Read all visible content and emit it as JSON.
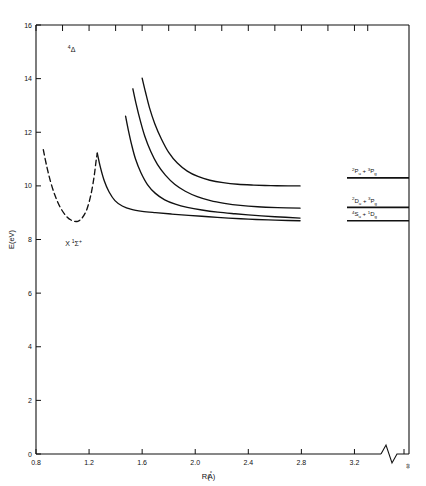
{
  "chart_data": {
    "type": "line",
    "title": "",
    "xlabel": "R(A)",
    "xlabel_parts": {
      "pre": "R(",
      "ring": "°",
      "mid": "A",
      "post": ")"
    },
    "ylabel": "E(eV)",
    "xlim": [
      0.8,
      3.4
    ],
    "ylim": [
      0,
      16
    ],
    "xticks": [
      "0.8",
      "1.2",
      "1.6",
      "2.0",
      "2.4",
      "2.8",
      "3.2"
    ],
    "xtick_values": [
      0.8,
      1.2,
      1.6,
      2.0,
      2.4,
      2.8,
      3.2
    ],
    "yticks": [
      "0",
      "2",
      "4",
      "6",
      "8",
      "10",
      "12",
      "14",
      "16"
    ],
    "ytick_values": [
      0,
      2,
      4,
      6,
      8,
      10,
      12,
      14,
      16
    ],
    "grid": false,
    "legend": "none",
    "axis_break": true,
    "infinity_tick": "∞",
    "annotations": [
      {
        "name": "quartet-delta-state",
        "text_parts": {
          "sup": "4",
          "main": "Δ"
        },
        "x": 1.04,
        "y": 15.0
      },
      {
        "name": "ground-state",
        "text_parts": {
          "x": "X ",
          "sup": "1",
          "main": "Σ",
          "post": "+"
        },
        "x": 1.02,
        "y": 7.75
      }
    ],
    "asymptote_levels": [
      {
        "name": "level-2Pu-3Pg",
        "energy": 10.3,
        "label_parts": {
          "a_sup": "2",
          "a_main": "P",
          "a_sub": "u",
          "plus": " + ",
          "b_sup": "3",
          "b_main": "P",
          "b_sub": "g"
        }
      },
      {
        "name": "level-2Du-3Pg",
        "energy": 9.2,
        "label_parts": {
          "a_sup": "2",
          "a_main": "D",
          "a_sub": "u",
          "plus": " + ",
          "b_sup": "3",
          "b_main": "P",
          "b_sub": "g"
        }
      },
      {
        "name": "level-4Su-1Dg",
        "energy": 8.7,
        "label_parts": {
          "a_sup": "4",
          "a_main": "S",
          "a_sub": "u",
          "plus": " + ",
          "b_sup": "1",
          "b_main": "D",
          "b_sub": "g"
        }
      }
    ],
    "series": [
      {
        "name": "ground-state-dashed-curve",
        "style": "dashed",
        "points": [
          [
            0.855,
            11.35
          ],
          [
            0.88,
            10.75
          ],
          [
            0.91,
            10.15
          ],
          [
            0.945,
            9.62
          ],
          [
            0.985,
            9.18
          ],
          [
            1.03,
            8.86
          ],
          [
            1.075,
            8.7
          ],
          [
            1.115,
            8.68
          ],
          [
            1.15,
            8.82
          ],
          [
            1.185,
            9.15
          ],
          [
            1.215,
            9.7
          ],
          [
            1.238,
            10.35
          ],
          [
            1.252,
            10.9
          ],
          [
            1.262,
            11.22
          ]
        ]
      },
      {
        "name": "curve-A-lowest",
        "style": "solid",
        "points": [
          [
            1.262,
            11.22
          ],
          [
            1.285,
            10.7
          ],
          [
            1.315,
            10.18
          ],
          [
            1.35,
            9.78
          ],
          [
            1.395,
            9.45
          ],
          [
            1.45,
            9.25
          ],
          [
            1.52,
            9.12
          ],
          [
            1.6,
            9.05
          ],
          [
            1.7,
            9.0
          ],
          [
            1.82,
            8.95
          ],
          [
            1.95,
            8.9
          ],
          [
            2.1,
            8.85
          ],
          [
            2.25,
            8.8
          ],
          [
            2.4,
            8.76
          ],
          [
            2.55,
            8.73
          ],
          [
            2.7,
            8.71
          ],
          [
            2.79,
            8.7
          ]
        ]
      },
      {
        "name": "curve-B",
        "style": "solid",
        "points": [
          [
            1.475,
            12.6
          ],
          [
            1.495,
            12.1
          ],
          [
            1.52,
            11.55
          ],
          [
            1.55,
            11.0
          ],
          [
            1.59,
            10.5
          ],
          [
            1.64,
            10.05
          ],
          [
            1.7,
            9.72
          ],
          [
            1.77,
            9.48
          ],
          [
            1.85,
            9.32
          ],
          [
            1.94,
            9.2
          ],
          [
            2.05,
            9.1
          ],
          [
            2.17,
            9.02
          ],
          [
            2.3,
            8.96
          ],
          [
            2.45,
            8.9
          ],
          [
            2.6,
            8.85
          ],
          [
            2.79,
            8.8
          ]
        ]
      },
      {
        "name": "curve-C",
        "style": "solid",
        "points": [
          [
            1.53,
            13.62
          ],
          [
            1.555,
            13.05
          ],
          [
            1.585,
            12.45
          ],
          [
            1.62,
            11.85
          ],
          [
            1.665,
            11.28
          ],
          [
            1.715,
            10.8
          ],
          [
            1.775,
            10.4
          ],
          [
            1.845,
            10.06
          ],
          [
            1.925,
            9.8
          ],
          [
            2.015,
            9.6
          ],
          [
            2.115,
            9.45
          ],
          [
            2.22,
            9.35
          ],
          [
            2.34,
            9.27
          ],
          [
            2.47,
            9.22
          ],
          [
            2.62,
            9.19
          ],
          [
            2.79,
            9.17
          ]
        ]
      },
      {
        "name": "curve-D-highest",
        "style": "solid",
        "points": [
          [
            1.6,
            14.02
          ],
          [
            1.625,
            13.5
          ],
          [
            1.655,
            12.92
          ],
          [
            1.695,
            12.32
          ],
          [
            1.745,
            11.75
          ],
          [
            1.8,
            11.25
          ],
          [
            1.865,
            10.85
          ],
          [
            1.94,
            10.55
          ],
          [
            2.02,
            10.35
          ],
          [
            2.11,
            10.21
          ],
          [
            2.21,
            10.12
          ],
          [
            2.32,
            10.06
          ],
          [
            2.44,
            10.03
          ],
          [
            2.57,
            10.01
          ],
          [
            2.7,
            10.0
          ],
          [
            2.79,
            10.0
          ]
        ]
      }
    ]
  }
}
